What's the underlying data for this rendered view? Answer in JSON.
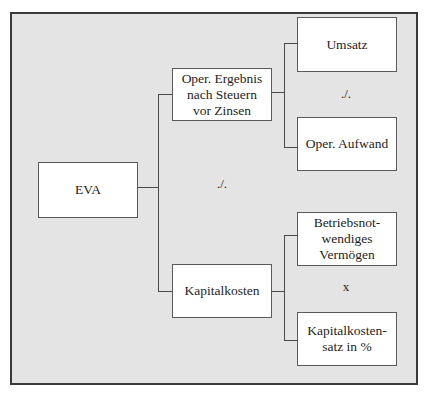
{
  "diagram": {
    "type": "tree",
    "root": {
      "label": "EVA"
    },
    "level1": [
      {
        "label": "Oper. Ergebnis\nnach Steuern\nvor Zinsen"
      },
      {
        "label": "Kapitalkosten"
      }
    ],
    "level2": [
      {
        "label": "Umsatz"
      },
      {
        "label": "Oper. Aufwand"
      },
      {
        "label": "Betriebsnot-\nwendiges\nVermögen"
      },
      {
        "label": "Kapitalkosten-\nsatz in %"
      }
    ],
    "operators": {
      "root_minus": "./.",
      "upper_minus": "./.",
      "lower_times": "x"
    }
  },
  "colors": {
    "background": "#e4e4e4",
    "box": "#ffffff",
    "border": "#3a3a3a"
  }
}
